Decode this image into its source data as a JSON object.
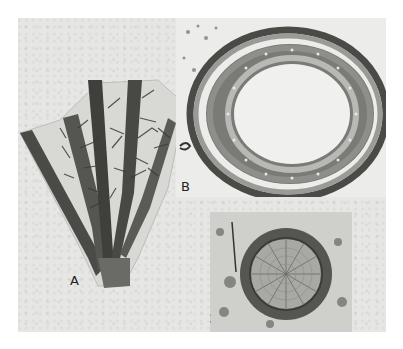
{
  "figure": {
    "panels": [
      {
        "id": "A",
        "label": "A",
        "subject": "branching fossil stem fragment with dark vascular strands"
      },
      {
        "id": "B",
        "label": "B",
        "subject": "transverse section of stem showing ring of wood around large pith"
      },
      {
        "id": "C",
        "label": "C",
        "subject": "transverse section of small stem with radiating xylem rows"
      }
    ]
  },
  "colors": {
    "page_bg": "#ffffff",
    "plate_bg": "#e6e6e4",
    "dark_tissue": "#3a3a38",
    "mid_tissue": "#7a7a76",
    "light_tissue": "#c8c8c4"
  }
}
